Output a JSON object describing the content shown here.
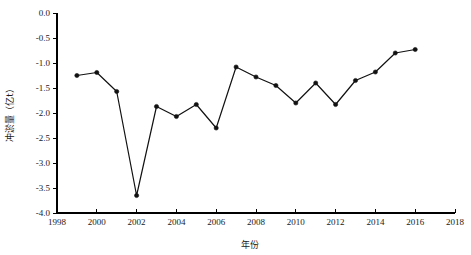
{
  "chart_data": {
    "type": "line",
    "title": "",
    "xlabel": "年份",
    "ylabel": "冲淤量（亿t）",
    "xlim": [
      1998,
      2018
    ],
    "ylim": [
      -4.0,
      0.0
    ],
    "grid": false,
    "legend": null,
    "x_ticks": [
      "1998",
      "2000",
      "2002",
      "2004",
      "2006",
      "2008",
      "2010",
      "2012",
      "2014",
      "2016",
      "2018"
    ],
    "x_tick_values": [
      1998,
      2000,
      2002,
      2004,
      2006,
      2008,
      2010,
      2012,
      2014,
      2016,
      2018
    ],
    "y_ticks": [
      "0.0",
      "-0.5",
      "-1.0",
      "-1.5",
      "-2.0",
      "-2.5",
      "-3.0",
      "-3.5",
      "-4.0"
    ],
    "y_tick_values": [
      0.0,
      -0.5,
      -1.0,
      -1.5,
      -2.0,
      -2.5,
      -3.0,
      -3.5,
      -4.0
    ],
    "x": [
      1999,
      2000,
      2001,
      2002,
      2003,
      2004,
      2005,
      2006,
      2007,
      2008,
      2009,
      2010,
      2011,
      2012,
      2013,
      2014,
      2015,
      2016
    ],
    "values": [
      -1.25,
      -1.19,
      -1.57,
      -3.65,
      -1.87,
      -2.07,
      -1.83,
      -2.3,
      -1.08,
      -1.28,
      -1.45,
      -1.8,
      -1.4,
      -1.83,
      -1.35,
      -1.18,
      -0.8,
      -0.73
    ],
    "series": [
      {
        "name": "冲淤量",
        "marker": "circle",
        "color": "#111111",
        "values": [
          -1.25,
          -1.19,
          -1.57,
          -3.65,
          -1.87,
          -2.07,
          -1.83,
          -2.3,
          -1.08,
          -1.28,
          -1.45,
          -1.8,
          -1.4,
          -1.83,
          -1.35,
          -1.18,
          -0.8,
          -0.73
        ]
      }
    ]
  },
  "colors": {
    "line": "#111111",
    "axis": "#000000",
    "background": "#ffffff",
    "text": "#1a1a1a"
  }
}
